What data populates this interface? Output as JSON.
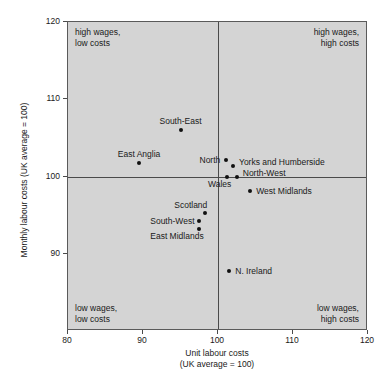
{
  "chart_data": {
    "type": "scatter",
    "title": "",
    "xlabel": "Unit labour costs",
    "xlabel_sub": "(UK average = 100)",
    "ylabel": "Monthly labour costs (UK average = 100)",
    "xlim": [
      80,
      120
    ],
    "ylim": [
      80,
      120
    ],
    "xticks": [
      80,
      90,
      100,
      110,
      120
    ],
    "yticks": [
      80,
      90,
      100,
      110,
      120
    ],
    "ytick_labels_shown": [
      "90",
      "100",
      "110",
      "120"
    ],
    "grid": false,
    "reference_lines": {
      "x": 100,
      "y": 100
    },
    "legend": "none",
    "plot_bg": "#d4d4d4",
    "point_color": "#111111",
    "points": [
      {
        "label": "South-East",
        "x": 95.0,
        "y": 106.0,
        "label_pos": "above"
      },
      {
        "label": "East Anglia",
        "x": 89.5,
        "y": 101.8,
        "label_pos": "above"
      },
      {
        "label": "North",
        "x": 101.0,
        "y": 102.1,
        "label_pos": "left"
      },
      {
        "label": "Yorks and Humberside",
        "x": 102.0,
        "y": 101.4,
        "label_pos": "right-up"
      },
      {
        "label": "Wales",
        "x": 101.2,
        "y": 100.0,
        "label_pos": "below-left"
      },
      {
        "label": "North-West",
        "x": 102.5,
        "y": 100.0,
        "label_pos": "right-up"
      },
      {
        "label": "West Midlands",
        "x": 104.3,
        "y": 98.1,
        "label_pos": "right"
      },
      {
        "label": "Scotland",
        "x": 98.3,
        "y": 95.3,
        "label_pos": "above-left"
      },
      {
        "label": "South-West",
        "x": 97.5,
        "y": 94.3,
        "label_pos": "left"
      },
      {
        "label": "East Midlands",
        "x": 97.5,
        "y": 93.2,
        "label_pos": "below-left"
      },
      {
        "label": "N. Ireland",
        "x": 101.5,
        "y": 87.8,
        "label_pos": "right"
      }
    ],
    "annotations": [
      {
        "id": "top-left",
        "line1": "high wages,",
        "line2": "low costs"
      },
      {
        "id": "top-right",
        "line1": "high wages,",
        "line2": "high costs"
      },
      {
        "id": "bottom-left",
        "line1": "low wages,",
        "line2": "low costs"
      },
      {
        "id": "bottom-right",
        "line1": "low wages,",
        "line2": "high costs"
      }
    ]
  }
}
